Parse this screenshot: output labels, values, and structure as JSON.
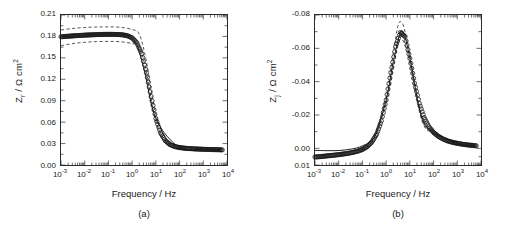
{
  "figure": {
    "panels": [
      {
        "caption": "(a)",
        "xlabel": "Frequency / Hz",
        "ylabel": "Z r / Ω cm2",
        "ylabel_base": "Z",
        "ylabel_sub": "r",
        "ylabel_rest": " / Ω cm",
        "ylabel_sup": "2"
      },
      {
        "caption": "(b)",
        "xlabel": "Frequency / Hz",
        "ylabel": "Z j / Ω cm2",
        "ylabel_base": "Z",
        "ylabel_sub": "j",
        "ylabel_rest": " / Ω cm",
        "ylabel_sup": "2"
      }
    ]
  },
  "chart_data": [
    {
      "type": "scatter",
      "panel": "(a)",
      "title": "",
      "xlabel": "Frequency / Hz",
      "ylabel": "Zr / Ω cm2",
      "xscale": "log",
      "xlim": [
        0.001,
        10000
      ],
      "ylim": [
        0.0,
        0.21
      ],
      "ytick_values": [
        0.0,
        0.03,
        0.06,
        0.09,
        0.12,
        0.15,
        0.18,
        0.21
      ],
      "ytick_labels": [
        "0.00",
        "0.03",
        "0.06",
        "0.09",
        "0.12",
        "0.15",
        "0.18",
        "0.21"
      ],
      "xtick_values": [
        0.001,
        0.01,
        0.1,
        1,
        10,
        100,
        1000,
        10000
      ],
      "xtick_labels": [
        "10-3",
        "10-2",
        "10-1",
        "100",
        "101",
        "102",
        "103",
        "104"
      ],
      "xtick_exponents": [
        "-3",
        "-2",
        "-1",
        "0",
        "1",
        "2",
        "3",
        "4"
      ],
      "grid": false,
      "legend": "none",
      "y_inverted": false,
      "series": [
        {
          "name": "measured data",
          "style": "open-circle-markers",
          "x": [
            0.001,
            0.00158,
            0.00251,
            0.00398,
            0.00631,
            0.01,
            0.0158,
            0.0251,
            0.0398,
            0.0631,
            0.1,
            0.158,
            0.251,
            0.398,
            0.631,
            1.0,
            1.58,
            2.51,
            3.98,
            6.31,
            10.0,
            15.8,
            25.1,
            39.8,
            63.1,
            100.0,
            158.0,
            251.0,
            398.0,
            631.0,
            1000.0,
            1580.0,
            2510.0,
            3980.0,
            6310.0
          ],
          "y": [
            0.1795,
            0.18,
            0.1805,
            0.181,
            0.1814,
            0.1818,
            0.1821,
            0.1824,
            0.1826,
            0.1828,
            0.1829,
            0.1829,
            0.1827,
            0.1822,
            0.181,
            0.178,
            0.171,
            0.156,
            0.129,
            0.096,
            0.065,
            0.045,
            0.034,
            0.0285,
            0.0258,
            0.0244,
            0.0236,
            0.023,
            0.0226,
            0.0223,
            0.022,
            0.0218,
            0.0216,
            0.0214,
            0.0212
          ]
        },
        {
          "name": "model fit",
          "style": "solid-line",
          "x": [
            0.001,
            0.01,
            0.1,
            1.0,
            3.0,
            10.0,
            100.0,
            1000.0,
            6310.0
          ],
          "y": [
            0.1796,
            0.1818,
            0.1829,
            0.178,
            0.138,
            0.065,
            0.0244,
            0.022,
            0.0212
          ]
        },
        {
          "name": "upper confidence bound",
          "style": "dashed-line",
          "x": [
            0.001,
            0.0032,
            0.01,
            0.032,
            0.1,
            0.32,
            1.0,
            2.0,
            4.0,
            10.0,
            32.0,
            100.0,
            1000.0,
            6310.0
          ],
          "y": [
            0.189,
            0.1912,
            0.1925,
            0.1932,
            0.1933,
            0.1928,
            0.1895,
            0.183,
            0.145,
            0.07,
            0.033,
            0.0258,
            0.0228,
            0.0218
          ]
        },
        {
          "name": "lower confidence bound",
          "style": "dashed-line",
          "x": [
            0.001,
            0.0032,
            0.01,
            0.032,
            0.1,
            0.32,
            1.0,
            2.0,
            4.0,
            10.0,
            32.0,
            100.0,
            1000.0,
            6310.0
          ],
          "y": [
            0.167,
            0.17,
            0.1718,
            0.1728,
            0.173,
            0.1726,
            0.17,
            0.165,
            0.13,
            0.0605,
            0.0295,
            0.0232,
            0.0212,
            0.0206
          ]
        }
      ]
    },
    {
      "type": "scatter",
      "panel": "(b)",
      "title": "",
      "xlabel": "Frequency / Hz",
      "ylabel": "Zj / Ω cm2",
      "xscale": "log",
      "xlim": [
        0.001,
        10000
      ],
      "ylim": [
        -0.08,
        0.01
      ],
      "y_inverted": true,
      "ytick_values": [
        -0.08,
        -0.06,
        -0.04,
        -0.02,
        0.0,
        0.01
      ],
      "ytick_labels": [
        "-0.08",
        "-0.06",
        "-0.04",
        "-0.02",
        "0.00",
        "0.01"
      ],
      "xtick_values": [
        0.001,
        0.01,
        0.1,
        1,
        10,
        100,
        1000,
        10000
      ],
      "xtick_labels": [
        "10-3",
        "10-2",
        "10-1",
        "100",
        "101",
        "102",
        "103",
        "104"
      ],
      "xtick_exponents": [
        "-3",
        "-2",
        "-1",
        "0",
        "1",
        "2",
        "3",
        "4"
      ],
      "grid": false,
      "legend": "none",
      "series": [
        {
          "name": "measured data",
          "style": "open-circle-markers",
          "x": [
            0.001,
            0.00158,
            0.00251,
            0.00398,
            0.00631,
            0.01,
            0.0158,
            0.0251,
            0.0398,
            0.0631,
            0.1,
            0.158,
            0.251,
            0.398,
            0.631,
            1.0,
            1.58,
            2.51,
            3.98,
            6.31,
            10.0,
            15.8,
            25.1,
            39.8,
            63.1,
            100.0,
            158.0,
            251.0,
            398.0,
            631.0,
            1000.0,
            1580.0,
            2510.0,
            3980.0,
            6310.0
          ],
          "y": [
            0.0052,
            0.005,
            0.0047,
            0.0044,
            0.0041,
            0.0038,
            0.0034,
            0.003,
            0.0024,
            0.0017,
            0.0007,
            -0.001,
            -0.0038,
            -0.0085,
            -0.0165,
            -0.029,
            -0.0455,
            -0.061,
            -0.0695,
            -0.067,
            -0.054,
            -0.039,
            -0.027,
            -0.0185,
            -0.013,
            -0.0095,
            -0.0072,
            -0.0056,
            -0.0044,
            -0.0036,
            -0.003,
            -0.0025,
            -0.0021,
            -0.0018,
            -0.0015
          ]
        },
        {
          "name": "model fit",
          "style": "solid-line",
          "x": [
            0.001,
            0.0032,
            0.01,
            0.032,
            0.1,
            0.32,
            1.0,
            2.0,
            4.0,
            6.0,
            10.0,
            32.0,
            100.0,
            1000.0,
            6310.0
          ],
          "y": [
            0.0012,
            0.0014,
            0.0013,
            0.0005,
            -0.0015,
            -0.007,
            -0.029,
            -0.052,
            -0.0695,
            -0.0675,
            -0.054,
            -0.018,
            -0.0095,
            -0.003,
            -0.0015
          ]
        },
        {
          "name": "upper confidence bound",
          "style": "dashed-line",
          "x": [
            0.1,
            0.32,
            1.0,
            2.0,
            3.2,
            4.5,
            6.0,
            10.0,
            32.0,
            100.0,
            1000.0,
            6310.0
          ],
          "y": [
            -0.0005,
            -0.0078,
            -0.031,
            -0.057,
            -0.074,
            -0.0755,
            -0.071,
            -0.056,
            -0.019,
            -0.0102,
            -0.0034,
            -0.0018
          ]
        },
        {
          "name": "lower confidence bound",
          "style": "dashed-line",
          "x": [
            0.1,
            0.32,
            1.0,
            2.0,
            3.2,
            4.5,
            6.0,
            10.0,
            32.0,
            100.0,
            1000.0,
            6310.0
          ],
          "y": [
            0.0012,
            -0.006,
            -0.027,
            -0.048,
            -0.063,
            -0.065,
            -0.0625,
            -0.051,
            -0.0168,
            -0.0088,
            -0.0026,
            -0.0012
          ]
        }
      ]
    }
  ],
  "style": {
    "axis_color": "#2b2b2b",
    "marker_color": "#1a1a1a",
    "line_color": "#1a1a1a",
    "background": "#ffffff"
  }
}
